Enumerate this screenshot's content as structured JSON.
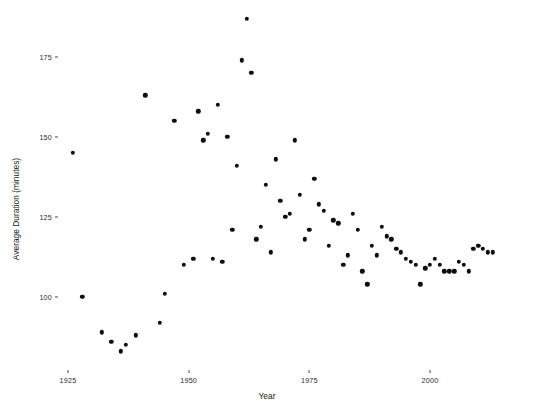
{
  "chart_data": {
    "type": "scatter",
    "title": "",
    "xlabel": "Year",
    "ylabel": "Average Duration (minutes)",
    "xlim": [
      1922,
      2018
    ],
    "ylim": [
      84,
      190
    ],
    "grid": false,
    "legend": null,
    "xticks": [
      1925,
      1950,
      1975,
      2000
    ],
    "yticks": [
      100,
      125,
      150,
      175
    ],
    "point_color": "#0d0d0d",
    "background_color": "#ffffff",
    "series": [
      {
        "name": "Average Duration",
        "points": [
          [
            1926,
            145
          ],
          [
            1928,
            100
          ],
          [
            1932,
            89
          ],
          [
            1934,
            86
          ],
          [
            1936,
            83
          ],
          [
            1937,
            85
          ],
          [
            1939,
            88
          ],
          [
            1941,
            163
          ],
          [
            1944,
            92
          ],
          [
            1945,
            101
          ],
          [
            1947,
            155
          ],
          [
            1949,
            110
          ],
          [
            1951,
            112
          ],
          [
            1952,
            158
          ],
          [
            1953,
            149
          ],
          [
            1954,
            151
          ],
          [
            1955,
            112
          ],
          [
            1956,
            160
          ],
          [
            1957,
            111
          ],
          [
            1958,
            150
          ],
          [
            1959,
            121
          ],
          [
            1960,
            141
          ],
          [
            1961,
            174
          ],
          [
            1962,
            187
          ],
          [
            1963,
            170
          ],
          [
            1964,
            118
          ],
          [
            1965,
            122
          ],
          [
            1966,
            135
          ],
          [
            1967,
            114
          ],
          [
            1968,
            143
          ],
          [
            1969,
            130
          ],
          [
            1970,
            125
          ],
          [
            1971,
            126
          ],
          [
            1972,
            149
          ],
          [
            1973,
            132
          ],
          [
            1974,
            118
          ],
          [
            1975,
            121
          ],
          [
            1976,
            137
          ],
          [
            1977,
            129
          ],
          [
            1978,
            127
          ],
          [
            1979,
            116
          ],
          [
            1980,
            124
          ],
          [
            1981,
            123
          ],
          [
            1982,
            110
          ],
          [
            1983,
            113
          ],
          [
            1984,
            126
          ],
          [
            1985,
            121
          ],
          [
            1986,
            108
          ],
          [
            1987,
            104
          ],
          [
            1988,
            116
          ],
          [
            1989,
            113
          ],
          [
            1990,
            122
          ],
          [
            1991,
            119
          ],
          [
            1992,
            118
          ],
          [
            1993,
            115
          ],
          [
            1994,
            114
          ],
          [
            1995,
            112
          ],
          [
            1996,
            111
          ],
          [
            1997,
            110
          ],
          [
            1998,
            104
          ],
          [
            1999,
            109
          ],
          [
            2000,
            110
          ],
          [
            2001,
            112
          ],
          [
            2002,
            110
          ],
          [
            2003,
            108
          ],
          [
            2004,
            108
          ],
          [
            2005,
            108
          ],
          [
            2006,
            111
          ],
          [
            2007,
            110
          ],
          [
            2008,
            108
          ],
          [
            2009,
            115
          ],
          [
            2010,
            116
          ],
          [
            2011,
            115
          ],
          [
            2012,
            114
          ],
          [
            2013,
            114
          ]
        ]
      }
    ]
  },
  "axes": {
    "x_title": "Year",
    "y_title": "Average Duration (minutes)",
    "x_tick_labels": [
      "1925",
      "1950",
      "1975",
      "2000"
    ],
    "y_tick_labels": [
      "100",
      "125",
      "150",
      "175"
    ]
  }
}
